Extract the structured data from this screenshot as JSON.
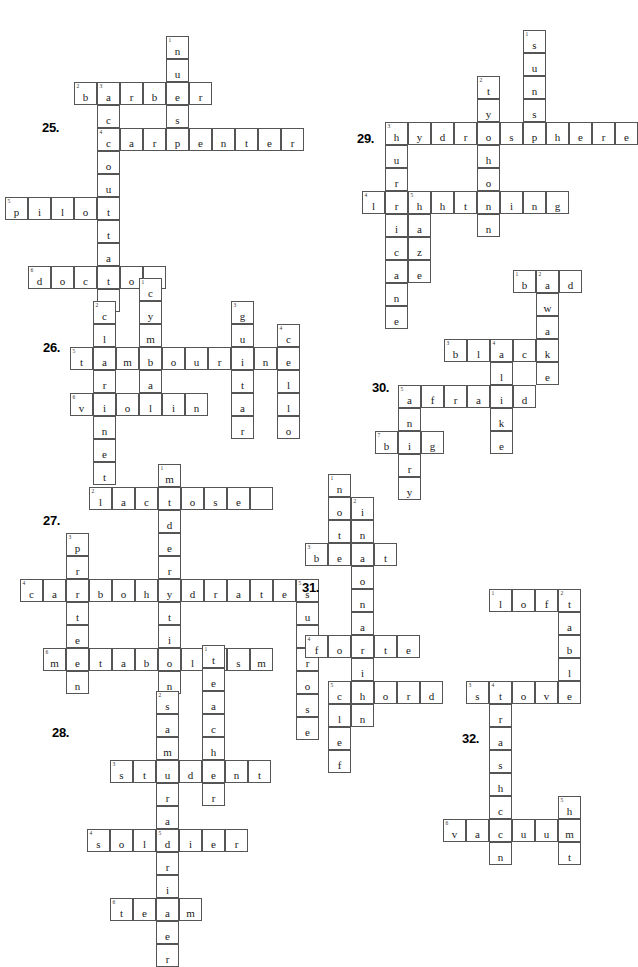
{
  "page": {
    "footer_mark": "",
    "cell_size": 23,
    "grid_color": "#555555",
    "text_color": "#1a1a1a"
  },
  "puzzles": [
    {
      "label": "25.",
      "label_x": 42,
      "label_y": 120,
      "origin_x": 28,
      "origin_y": 36,
      "theme": "occupations",
      "entries": [
        {
          "number": "1",
          "answer": "nurse",
          "direction": "down",
          "col": 6,
          "row": 0
        },
        {
          "number": "2",
          "answer": "barber",
          "direction": "across",
          "col": 2,
          "row": 2
        },
        {
          "number": "3",
          "answer": "accountant",
          "direction": "down",
          "col": 3,
          "row": 2
        },
        {
          "number": "4",
          "answer": "carpenter",
          "direction": "across",
          "col": 3,
          "row": 4
        },
        {
          "number": "5",
          "answer": "pilot",
          "direction": "across",
          "col": -1,
          "row": 7
        },
        {
          "number": "6",
          "answer": "doctor",
          "direction": "across",
          "col": 0,
          "row": 10
        }
      ]
    },
    {
      "label": "29.",
      "label_x": 357,
      "label_y": 131,
      "origin_x": 385,
      "origin_y": 30,
      "theme": "weather",
      "entries": [
        {
          "number": "1",
          "answer": "suns",
          "direction": "down",
          "col": 6,
          "row": 0
        },
        {
          "number": "2",
          "answer": "typhoon",
          "direction": "down",
          "col": 4,
          "row": 2
        },
        {
          "number": "3",
          "answer": "hydrosphere",
          "direction": "across",
          "col": 0,
          "row": 4
        },
        {
          "number": "4",
          "answer": "lightning",
          "direction": "across",
          "col": -1,
          "row": 7
        },
        {
          "number": "5",
          "answer": "haze",
          "direction": "down",
          "col": 1,
          "row": 7
        },
        {
          "number": "6",
          "answer": "hurricane",
          "direction": "down",
          "col": 0,
          "row": 4
        }
      ]
    },
    {
      "label": "26.",
      "label_x": 43,
      "label_y": 340,
      "origin_x": 70,
      "origin_y": 278,
      "theme": "musical-instruments",
      "entries": [
        {
          "number": "1",
          "answer": "cymbal",
          "direction": "down",
          "col": 3,
          "row": 0
        },
        {
          "number": "2",
          "answer": "clarinet",
          "direction": "down",
          "col": 1,
          "row": 1
        },
        {
          "number": "3",
          "answer": "guitar",
          "direction": "down",
          "col": 7,
          "row": 1
        },
        {
          "number": "4",
          "answer": "cello",
          "direction": "down",
          "col": 9,
          "row": 2
        },
        {
          "number": "5",
          "answer": "tambourine",
          "direction": "across",
          "col": 0,
          "row": 3
        },
        {
          "number": "6",
          "answer": "violin",
          "direction": "across",
          "col": 0,
          "row": 5
        }
      ]
    },
    {
      "label": "30.",
      "label_x": 372,
      "label_y": 380,
      "origin_x": 398,
      "origin_y": 270,
      "theme": "adjectives",
      "entries": [
        {
          "number": "1",
          "answer": "bad",
          "direction": "across",
          "col": 5,
          "row": 0
        },
        {
          "number": "2",
          "answer": "awake",
          "direction": "down",
          "col": 6,
          "row": 0
        },
        {
          "number": "3",
          "answer": "black",
          "direction": "across",
          "col": 2,
          "row": 3
        },
        {
          "number": "4",
          "answer": "alike",
          "direction": "down",
          "col": 4,
          "row": 3
        },
        {
          "number": "5",
          "answer": "afraid",
          "direction": "across",
          "col": 0,
          "row": 5
        },
        {
          "number": "6",
          "answer": "angry",
          "direction": "down",
          "col": 0,
          "row": 5
        },
        {
          "number": "7",
          "answer": "big",
          "direction": "across",
          "col": -1,
          "row": 7
        }
      ]
    },
    {
      "label": "27.",
      "label_x": 43,
      "label_y": 513,
      "origin_x": 20,
      "origin_y": 464,
      "theme": "nutrition",
      "entries": [
        {
          "number": "1",
          "answer": "moderation",
          "direction": "down",
          "col": 6,
          "row": 0
        },
        {
          "number": "2",
          "answer": "lactose",
          "direction": "across",
          "col": 3,
          "row": 1,
          "trailing_blank": 1
        },
        {
          "number": "3",
          "answer": "protein",
          "direction": "down",
          "col": 2,
          "row": 3
        },
        {
          "number": "4",
          "answer": "carbohydrates",
          "direction": "across",
          "col": 0,
          "row": 5
        },
        {
          "number": "5",
          "answer": "sucrose",
          "direction": "down",
          "col": 12,
          "row": 5
        },
        {
          "number": "6",
          "answer": "metabolism",
          "direction": "across",
          "col": 1,
          "row": 8
        }
      ]
    },
    {
      "label": "31.",
      "label_x": 302,
      "label_y": 580,
      "origin_x": 305,
      "origin_y": 474,
      "theme": "music-terms",
      "entries": [
        {
          "number": "1",
          "answer": "not",
          "direction": "down",
          "col": 1,
          "row": 0
        },
        {
          "number": "2",
          "answer": "intonation",
          "direction": "down",
          "col": 2,
          "row": 1
        },
        {
          "number": "3",
          "answer": "beat",
          "direction": "across",
          "col": 0,
          "row": 3
        },
        {
          "number": "4",
          "answer": "forte",
          "direction": "across",
          "col": 0,
          "row": 7
        },
        {
          "number": "5",
          "answer": "chord",
          "direction": "across",
          "col": 1,
          "row": 9
        },
        {
          "number": "6",
          "answer": "clef",
          "direction": "down",
          "col": 1,
          "row": 9
        }
      ]
    },
    {
      "label": "28.",
      "label_x": 52,
      "label_y": 725,
      "origin_x": 110,
      "origin_y": 645,
      "theme": "people",
      "entries": [
        {
          "number": "1",
          "answer": "teacher",
          "direction": "down",
          "col": 4,
          "row": 0
        },
        {
          "number": "2",
          "answer": "samurai",
          "direction": "down",
          "col": 2,
          "row": 2
        },
        {
          "number": "3",
          "answer": "student",
          "direction": "across",
          "col": 0,
          "row": 5
        },
        {
          "number": "4",
          "answer": "soldier",
          "direction": "across",
          "col": -1,
          "row": 8
        },
        {
          "number": "5",
          "answer": "driver",
          "direction": "down",
          "col": 2,
          "row": 8
        },
        {
          "number": "6",
          "answer": "team",
          "direction": "across",
          "col": 0,
          "row": 11
        }
      ]
    },
    {
      "label": "32.",
      "label_x": 462,
      "label_y": 731,
      "origin_x": 443,
      "origin_y": 589,
      "theme": "household",
      "entries": [
        {
          "number": "1",
          "answer": "loft",
          "direction": "across",
          "col": 2,
          "row": 0
        },
        {
          "number": "2",
          "answer": "table",
          "direction": "down",
          "col": 5,
          "row": 0
        },
        {
          "number": "3",
          "answer": "stove",
          "direction": "across",
          "col": 1,
          "row": 4
        },
        {
          "number": "4",
          "answer": "trashcan",
          "direction": "down",
          "col": 2,
          "row": 4
        },
        {
          "number": "5",
          "answer": "hut",
          "direction": "down",
          "col": 5,
          "row": 9
        },
        {
          "number": "6",
          "answer": "vacuum",
          "direction": "across",
          "col": 0,
          "row": 10
        }
      ]
    }
  ]
}
